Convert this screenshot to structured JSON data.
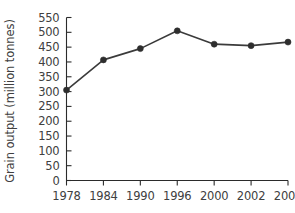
{
  "chart_data": {
    "type": "line",
    "title": "",
    "xlabel": "",
    "ylabel": "Grain output (million tonnes)",
    "categories": [
      "1978",
      "1984",
      "1990",
      "1996",
      "2000",
      "2002",
      "2004"
    ],
    "values": [
      305,
      407,
      445,
      505,
      460,
      455,
      467
    ],
    "series": [
      {
        "name": "Grain output",
        "values": [
          305,
          407,
          445,
          505,
          460,
          455,
          467
        ]
      }
    ],
    "ylim": [
      0,
      550
    ],
    "yticks": [
      0,
      50,
      100,
      150,
      200,
      250,
      300,
      350,
      400,
      450,
      500,
      550
    ],
    "ytick_labels": [
      "0",
      "50",
      "100",
      "150",
      "200",
      "250",
      "300",
      "350",
      "400",
      "450",
      "500",
      "550"
    ],
    "xtick_labels": [
      "1978",
      "1984",
      "1990",
      "1996",
      "2000",
      "2002",
      "2004"
    ],
    "grid": false,
    "legend": false,
    "legend_position": "none",
    "marker": "filled-circle",
    "colors": {
      "line": "#3b3b3b",
      "marker": "#2e2e2e",
      "axis": "#2b2b2b",
      "text": "#404040",
      "background": "#ffffff"
    }
  }
}
